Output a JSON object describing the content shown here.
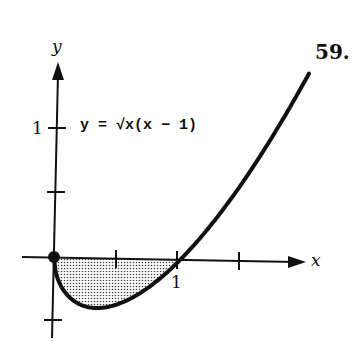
{
  "problem_number": "59.",
  "equation": "y = √x(x − 1)",
  "axes": {
    "x_label": "x",
    "y_label": "y",
    "x_tick_label": "1",
    "y_tick_label": "1"
  },
  "chart_data": {
    "type": "line",
    "title": "y = √x(x − 1)",
    "xlabel": "x",
    "ylabel": "y",
    "function": "sqrt(x)*(x-1)",
    "x": [
      0,
      0.1,
      0.2,
      0.333,
      0.5,
      0.7,
      1.0,
      1.25,
      1.5,
      1.75,
      2.0
    ],
    "values": [
      0,
      -0.285,
      -0.358,
      -0.385,
      -0.354,
      -0.251,
      0,
      0.28,
      0.612,
      0.992,
      1.414
    ],
    "xlim": [
      -0.3,
      2.1
    ],
    "ylim": [
      -0.65,
      1.5
    ],
    "x_ticks": [
      0.5,
      1,
      1.5
    ],
    "y_ticks": [
      -0.5,
      0.5,
      1
    ],
    "labeled_ticks": {
      "x": [
        1
      ],
      "y": [
        1
      ]
    },
    "shaded_region": {
      "from_x": 0,
      "to_x": 1,
      "between": "curve and x-axis",
      "pattern": "dotted"
    },
    "point": {
      "x": 0,
      "y": 0,
      "filled": true
    },
    "grid": false
  }
}
